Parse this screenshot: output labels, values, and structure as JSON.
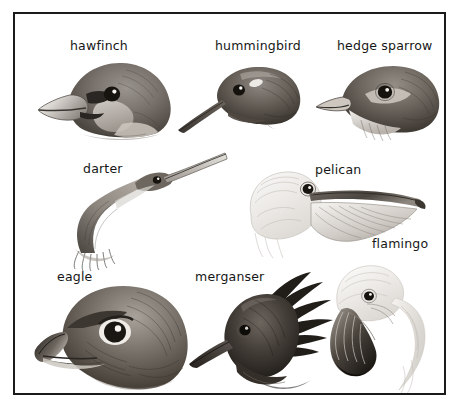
{
  "plate": {
    "title": "Bird beak types",
    "border_color": "#1a1a1a",
    "background_color": "#ffffff",
    "ink_color": "#161616",
    "medium": "pencil illustration"
  },
  "figures": [
    {
      "id": "hawfinch",
      "label": "hawfinch",
      "row": 1,
      "column": 1,
      "beak_type": "thick conical seed-cracking bill",
      "label_x": 55,
      "label_y": 32,
      "fig_x": 28,
      "fig_y": 48,
      "fig_w": 130,
      "fig_h": 80
    },
    {
      "id": "hummingbird",
      "label": "hummingbird",
      "row": 1,
      "column": 2,
      "beak_type": "long slender needle-like bill",
      "label_x": 200,
      "label_y": 32,
      "fig_x": 168,
      "fig_y": 50,
      "fig_w": 125,
      "fig_h": 70
    },
    {
      "id": "hedge-sparrow",
      "label": "hedge sparrow",
      "row": 1,
      "column": 3,
      "beak_type": "fine pointed insect-eating bill",
      "label_x": 322,
      "label_y": 32,
      "fig_x": 312,
      "fig_y": 50,
      "fig_w": 118,
      "fig_h": 76
    },
    {
      "id": "darter",
      "label": "darter",
      "row": 2,
      "column": 1,
      "beak_type": "long dagger spear-fishing bill",
      "label_x": 68,
      "label_y": 155,
      "fig_x": 56,
      "fig_y": 148,
      "fig_w": 145,
      "fig_h": 95
    },
    {
      "id": "pelican",
      "label": "pelican",
      "row": 2,
      "column": 2,
      "beak_type": "large pouched scooping bill",
      "label_x": 300,
      "label_y": 156,
      "fig_x": 228,
      "fig_y": 155,
      "fig_w": 185,
      "fig_h": 90
    },
    {
      "id": "flamingo",
      "label": "flamingo",
      "row": 3,
      "column": 3,
      "beak_type": "down-bent filter-feeding bill",
      "label_x": 357,
      "label_y": 230,
      "fig_x": 316,
      "fig_y": 250,
      "fig_w": 120,
      "fig_h": 130
    },
    {
      "id": "eagle",
      "label": "eagle",
      "row": 3,
      "column": 1,
      "beak_type": "hooked raptor tearing bill",
      "label_x": 42,
      "label_y": 263,
      "fig_x": 26,
      "fig_y": 268,
      "fig_w": 150,
      "fig_h": 112
    },
    {
      "id": "merganser",
      "label": "merganser",
      "row": 3,
      "column": 2,
      "beak_type": "narrow serrated fish-gripping bill",
      "label_x": 180,
      "label_y": 263,
      "fig_x": 182,
      "fig_y": 265,
      "fig_w": 135,
      "fig_h": 118
    }
  ]
}
